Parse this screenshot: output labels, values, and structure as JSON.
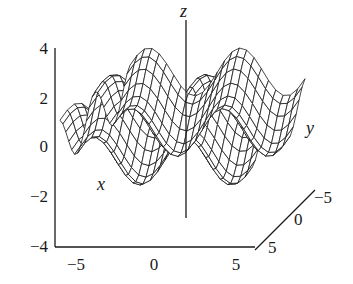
{
  "chart_data": {
    "type": "surface",
    "function": "z = sin(x) + cos(y)",
    "x_range": [
      -6,
      6
    ],
    "y_range": [
      -6,
      6
    ],
    "grid": 24,
    "zlim": [
      -4,
      4
    ],
    "z_ticks": [
      "4",
      "2",
      "0",
      "−2",
      "−4"
    ],
    "x_ticks": [
      "−5",
      "0",
      "5"
    ],
    "y_ticks": [
      "−5",
      "0",
      "5"
    ],
    "axis_labels": {
      "x": "x",
      "y": "y",
      "z": "z"
    },
    "colors": {
      "mesh": "#1a1a1a",
      "face": "#ffffff",
      "axis": "#1a1a1a"
    }
  }
}
